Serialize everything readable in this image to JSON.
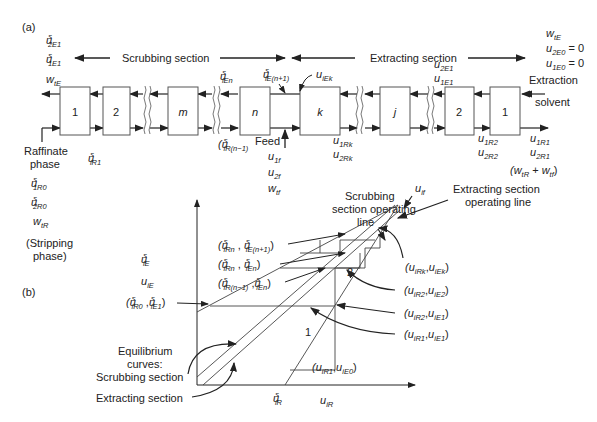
{
  "panel_a": {
    "label": "(a)",
    "scrubbing_section": "Scrubbing section",
    "extracting_section": "Extracting section",
    "stages_scrubbing": [
      "1",
      "2",
      "m",
      "n"
    ],
    "stages_extracting": [
      "k",
      "j",
      "2",
      "1"
    ],
    "left_top_labels": [
      "u^s_2E1",
      "u^s_1E1"
    ],
    "left_w": "w_tE",
    "raffinate_label": [
      "Raffinate",
      "phase"
    ],
    "raffinate_values": [
      "u^s_1R0",
      "u^s_2R0",
      "w_tR"
    ],
    "stripping_label": [
      "(Stripping",
      "phase)"
    ],
    "u_iR1": "u^s_iR1",
    "u_iEn": "u^s_iEn",
    "u_iE_n1": "u^s_iE(n+1)",
    "u_iEk": "u_iEk",
    "u_iR_n_1": "(u^s_iR(n-1)",
    "feed_label": "Feed",
    "feed_values": [
      "u_1f",
      "u_2f",
      "w_tf"
    ],
    "u_Rk": [
      "u_1Rk",
      "u_2Rk"
    ],
    "u_R2": [
      "u_1R2",
      "u_2R2"
    ],
    "u_R1": [
      "u_1R1",
      "u_2R1"
    ],
    "w_sum": "(w_tR + w_tf)",
    "u_E1": [
      "u_2E1",
      "u_1E1"
    ],
    "right_top": [
      "w_tE",
      "u_2E0 = 0",
      "u_1E0 = 0"
    ],
    "solvent_label": [
      "Extraction",
      "solvent"
    ]
  },
  "panel_b": {
    "label": "(b)",
    "y_axis_labels": [
      "u^s_iE",
      "u_iE"
    ],
    "x_axis_labels": [
      "u^s_iR",
      "u_iR"
    ],
    "scrubbing_op_line": [
      "Scrubbing",
      "section operating",
      "line"
    ],
    "extracting_op_line": [
      "Extracting section",
      "operating line"
    ],
    "u_if": "u_if",
    "equilibrium_label": [
      "Equilibrium",
      "curves:",
      "Scrubbing section"
    ],
    "extracting_section_label": "Extracting section",
    "points_left": [
      "(u^s_iRn , u^s_iE(n+1))",
      "(u^s_iRn , u^s_iEn)",
      "(u^s_iR(n-1) , u^s_iEn)",
      "(u^s_iR0 , u^s_iE1)"
    ],
    "points_right": [
      "(u_iRk, u_iEk)",
      "(u_iR2, u_iE2)",
      "(u_iR2, u_iE1)",
      "(u_iR1, u_iE1)",
      "(u_iR1, u_iE0)"
    ],
    "stage_numbers": [
      "1",
      "2"
    ]
  }
}
